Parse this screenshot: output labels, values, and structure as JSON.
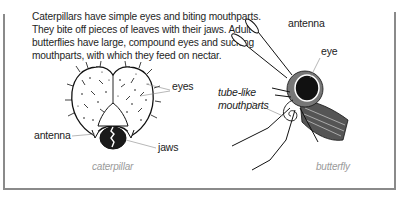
{
  "intro": {
    "lines": [
      "Caterpillars have simple eyes and biting mouthparts.",
      "They bite off pieces of leaves with their jaws. Adult",
      "butterflies have large, compound eyes and sucking",
      "mouthparts, with which they feed on nectar."
    ]
  },
  "caterpillar": {
    "labels": {
      "eyes": "eyes",
      "antenna": "antenna",
      "jaws": "jaws"
    },
    "caption": "caterpillar"
  },
  "butterfly": {
    "labels": {
      "antenna": "antenna",
      "eye": "eye",
      "mouthparts_line1": "tube-like",
      "mouthparts_line2": "mouthparts"
    },
    "caption": "butterfly"
  },
  "colors": {
    "frame": "#8a8a8a",
    "text": "#222222",
    "caption": "#9a9a9a"
  }
}
